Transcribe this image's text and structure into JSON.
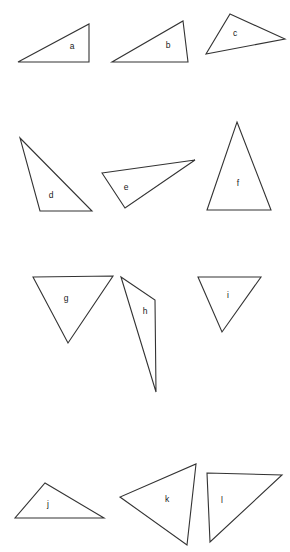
{
  "figure": {
    "canvas": {
      "width": 290,
      "height": 552
    },
    "background_color": "#ffffff",
    "stroke_color": "#333333",
    "label_color": "#1a1a1a",
    "fill_color": "#ffffff"
  },
  "chart_data": {
    "type": "diagram",
    "shape_type": "triangle",
    "count": 12,
    "labels": [
      "a",
      "b",
      "c",
      "d",
      "e",
      "f",
      "g",
      "h",
      "i",
      "j",
      "k",
      "l"
    ],
    "rows": [
      {
        "row": 1,
        "labels": [
          "a",
          "b",
          "c"
        ]
      },
      {
        "row": 2,
        "labels": [
          "d",
          "e",
          "f"
        ]
      },
      {
        "row": 3,
        "labels": [
          "g",
          "h",
          "i"
        ]
      },
      {
        "row": 4,
        "labels": [
          "j",
          "k",
          "l"
        ]
      }
    ],
    "shapes": [
      {
        "label": "a",
        "points": "18,62 89,62 89,24",
        "label_x": 72,
        "label_y": 47,
        "orientation": "right triangle, right angle bottom-right"
      },
      {
        "label": "b",
        "points": "112,62 188,62 183,21",
        "label_x": 168,
        "label_y": 46,
        "orientation": "obtuse, apex upper-right"
      },
      {
        "label": "c",
        "points": "230,14 285,39 206,54",
        "label_x": 235,
        "label_y": 34,
        "orientation": "scalene, rotated"
      },
      {
        "label": "d",
        "points": "20,138 92,211 40,211",
        "label_x": 51,
        "label_y": 196,
        "orientation": "scalene, apex top-left"
      },
      {
        "label": "e",
        "points": "102,173 195,160 125,208",
        "label_x": 126,
        "label_y": 188,
        "orientation": "thin scalene pointing right"
      },
      {
        "label": "f",
        "points": "237,122 271,210 207,210",
        "label_x": 238,
        "label_y": 184,
        "orientation": "isosceles, apex up"
      },
      {
        "label": "g",
        "points": "33,277 113,276 68,343",
        "label_x": 66,
        "label_y": 299,
        "orientation": "inverted, apex down"
      },
      {
        "label": "h",
        "points": "121,277 155,300 156,392",
        "label_x": 145,
        "label_y": 312,
        "orientation": "narrow sliver, elongated down"
      },
      {
        "label": "i",
        "points": "198,277 261,277 222,332",
        "label_x": 228,
        "label_y": 296,
        "orientation": "inverted, apex down"
      },
      {
        "label": "j",
        "points": "15,518 104,518 45,483",
        "label_x": 48,
        "label_y": 505,
        "orientation": "obtuse, apex upper-left"
      },
      {
        "label": "k",
        "points": "196,464 187,545 120,497",
        "label_x": 167,
        "label_y": 500,
        "orientation": "scalene, rotated"
      },
      {
        "label": "l",
        "points": "207,473 282,475 210,542",
        "label_x": 222,
        "label_y": 501,
        "orientation": "right triangle, right angle top-left"
      }
    ]
  }
}
